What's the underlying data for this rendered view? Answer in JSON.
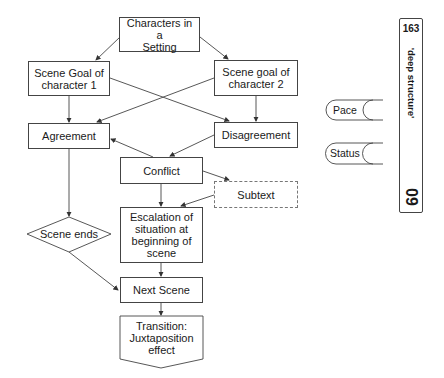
{
  "diagram": {
    "nodes": {
      "characters": "Characters in a\nSetting",
      "goal1": "Scene Goal of\ncharacter 1",
      "goal2": "Scene goal of\ncharacter 2",
      "agreement": "Agreement",
      "disagreement": "Disagreement",
      "conflict": "Conflict",
      "subtext": "Subtext",
      "escalation": "Escalation of\nsituation at\nbeginning of\nscene",
      "scene_ends": "Scene ends",
      "next_scene": "Next Scene",
      "transition": "Transition:\nJuxtaposition\neffect"
    },
    "edges": [
      [
        "characters",
        "goal1"
      ],
      [
        "characters",
        "goal2"
      ],
      [
        "goal1",
        "agreement"
      ],
      [
        "goal1",
        "disagreement"
      ],
      [
        "goal2",
        "agreement"
      ],
      [
        "goal2",
        "disagreement"
      ],
      [
        "disagreement",
        "conflict"
      ],
      [
        "conflict",
        "agreement"
      ],
      [
        "conflict",
        "subtext"
      ],
      [
        "subtext",
        "escalation"
      ],
      [
        "conflict",
        "escalation"
      ],
      [
        "agreement",
        "scene_ends"
      ],
      [
        "scene_ends",
        "next_scene"
      ],
      [
        "escalation",
        "next_scene"
      ],
      [
        "next_scene",
        "transition"
      ]
    ]
  },
  "side_tags": {
    "pace": "Pace",
    "status": "Status"
  },
  "chapter_tab": {
    "page": "163",
    "title": "'deep structure'",
    "chapter": "09"
  }
}
